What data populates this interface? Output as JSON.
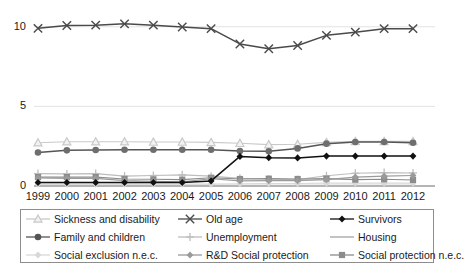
{
  "chart_data": {
    "type": "line",
    "title": "",
    "subtitle": "",
    "xlabel": "",
    "ylabel": "",
    "xlim": [
      1999,
      2012
    ],
    "ylim": [
      0,
      10.8
    ],
    "yticks": [
      0,
      5,
      10
    ],
    "ytick_labels": [
      "0",
      "5",
      "10"
    ],
    "grid": true,
    "grid_axis": "y",
    "legend_position": "bottom",
    "legend_columns": 3,
    "categories": [
      1999,
      2000,
      2001,
      2002,
      2003,
      2004,
      2005,
      2006,
      2007,
      2008,
      2009,
      2010,
      2011,
      2012
    ],
    "xtick_labels": [
      "1999",
      "2000",
      "2001",
      "2002",
      "2003",
      "2004",
      "2005",
      "2006",
      "2007",
      "2008",
      "2009",
      "2010",
      "2011",
      "2012"
    ],
    "series": [
      {
        "name": "Sickness and disability",
        "marker": "triangle",
        "color": "#c9c9c9",
        "line_color": "#c9c9c9",
        "values": [
          2.72,
          2.78,
          2.78,
          2.78,
          2.76,
          2.76,
          2.74,
          2.68,
          2.6,
          2.62,
          2.74,
          2.8,
          2.8,
          2.8
        ]
      },
      {
        "name": "Old age",
        "marker": "cross",
        "color": "#4a4a4a",
        "line_color": "#4a4a4a",
        "values": [
          9.9,
          10.08,
          10.1,
          10.18,
          10.1,
          9.98,
          9.88,
          8.92,
          8.62,
          8.82,
          9.46,
          9.66,
          9.88,
          9.88
        ]
      },
      {
        "name": "Survivors",
        "marker": "diamond",
        "color": "#111111",
        "line_color": "#111111",
        "values": [
          0.22,
          0.22,
          0.22,
          0.22,
          0.22,
          0.22,
          0.32,
          1.86,
          1.78,
          1.76,
          1.88,
          1.88,
          1.88,
          1.88
        ]
      },
      {
        "name": "Family and children",
        "marker": "circle",
        "color": "#6e6e6e",
        "line_color": "#555555",
        "values": [
          2.1,
          2.24,
          2.26,
          2.28,
          2.28,
          2.28,
          2.28,
          2.2,
          2.18,
          2.36,
          2.66,
          2.76,
          2.76,
          2.72
        ]
      },
      {
        "name": "Unemployment",
        "marker": "plus",
        "color": "#bdbdbd",
        "line_color": "#bdbdbd",
        "values": [
          0.78,
          0.76,
          0.78,
          0.62,
          0.66,
          0.7,
          0.62,
          0.48,
          0.42,
          0.4,
          0.64,
          0.8,
          0.84,
          0.82
        ]
      },
      {
        "name": "Housing",
        "marker": "none",
        "color": "#b5b5b5",
        "line_color": "#b5b5b5",
        "values": [
          0.05,
          0.05,
          0.05,
          0.05,
          0.05,
          0.05,
          0.05,
          0.05,
          0.05,
          0.05,
          0.05,
          0.05,
          0.05,
          0.05
        ]
      },
      {
        "name": "Social exclusion n.e.c.",
        "marker": "diamond",
        "color": "#d8d8d8",
        "line_color": "#d8d8d8",
        "values": [
          0.12,
          0.12,
          0.12,
          0.12,
          0.12,
          0.12,
          0.12,
          0.14,
          0.16,
          0.16,
          0.18,
          0.18,
          0.18,
          0.18
        ]
      },
      {
        "name": "R&D Social protection",
        "marker": "diamond",
        "color": "#9a9a9a",
        "line_color": "#9a9a9a",
        "values": [
          0.5,
          0.48,
          0.48,
          0.34,
          0.3,
          0.26,
          0.46,
          0.32,
          0.34,
          0.34,
          0.4,
          0.56,
          0.62,
          0.66
        ]
      },
      {
        "name": "Social protection n.e.c.",
        "marker": "square",
        "color": "#8c8c8c",
        "line_color": "#8c8c8c",
        "values": [
          0.56,
          0.56,
          0.56,
          0.44,
          0.42,
          0.4,
          0.52,
          0.44,
          0.46,
          0.44,
          0.46,
          0.4,
          0.42,
          0.38
        ]
      }
    ]
  },
  "legend": {
    "items": [
      {
        "label": "Sickness and disability",
        "marker": "triangle",
        "color": "#c9c9c9"
      },
      {
        "label": "Old age",
        "marker": "cross",
        "color": "#4a4a4a"
      },
      {
        "label": "Survivors",
        "marker": "diamond",
        "color": "#111111"
      },
      {
        "label": "Family and children",
        "marker": "circle",
        "color": "#555555"
      },
      {
        "label": "Unemployment",
        "marker": "plus",
        "color": "#bdbdbd"
      },
      {
        "label": "Housing",
        "marker": "none",
        "color": "#b5b5b5"
      },
      {
        "label": "Social exclusion n.e.c.",
        "marker": "diamond",
        "color": "#d8d8d8"
      },
      {
        "label": "R&D Social protection",
        "marker": "diamond",
        "color": "#9a9a9a"
      },
      {
        "label": "Social protection n.e.c.",
        "marker": "square",
        "color": "#8c8c8c"
      }
    ]
  },
  "axes": {
    "y_ticks": [
      "10",
      "5",
      "0"
    ],
    "x_ticks": [
      "1999",
      "2000",
      "2001",
      "2002",
      "2003",
      "2004",
      "2005",
      "2006",
      "2007",
      "2008",
      "2009",
      "2010",
      "2011",
      "2012"
    ]
  },
  "colors": {
    "axis_line": "#6d6d6d",
    "grid_line": "#e2e2e2",
    "text": "#1a1a1a",
    "legend_border": "#8d8d8d"
  }
}
